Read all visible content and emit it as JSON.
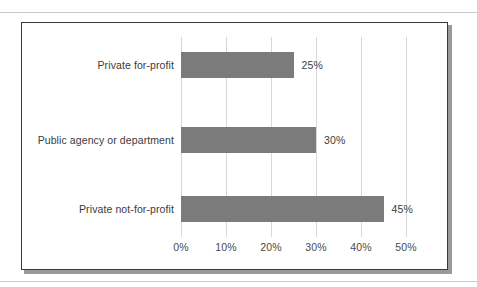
{
  "figure": {
    "frame_border_color": "#3a3a3a",
    "shadow_color": "#9a9a9a",
    "page_rule_color": "#c9c9c9",
    "background": "#ffffff"
  },
  "chart_data": {
    "type": "bar",
    "orientation": "horizontal",
    "title": "",
    "subtitle": "",
    "xlabel": "",
    "ylabel": "",
    "categories": [
      "Private for-profit",
      "Public agency or department",
      "Private not-for-profit"
    ],
    "values": [
      25,
      30,
      45
    ],
    "value_labels": [
      "25%",
      "30%",
      "45%"
    ],
    "xlim": [
      0,
      50
    ],
    "xticks": [
      0,
      10,
      20,
      30,
      40,
      50
    ],
    "xtick_labels": [
      "0%",
      "10%",
      "20%",
      "30%",
      "40%",
      "50%"
    ],
    "grid": "vertical",
    "legend": "none",
    "bar_color": "#7b7b7b",
    "gridline_color": "#d8d8d8",
    "text_color": "#3b3b3b"
  }
}
